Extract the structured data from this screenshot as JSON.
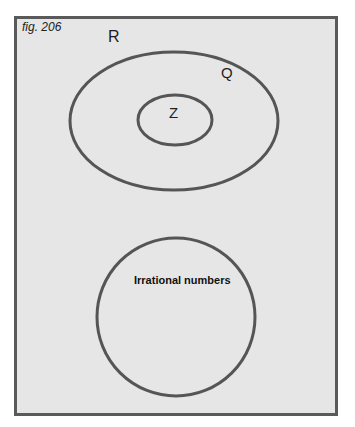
{
  "figure": {
    "caption": "fig. 206",
    "sets": [
      {
        "id": "R",
        "label": "R",
        "description": "outer frame (real numbers)"
      },
      {
        "id": "Q",
        "label": "Q",
        "shape": "ellipse",
        "cx": 174,
        "cy": 121,
        "rx": 104,
        "ry": 69
      },
      {
        "id": "Z",
        "label": "Z",
        "shape": "ellipse",
        "cx": 175,
        "cy": 120,
        "rx": 37,
        "ry": 25
      },
      {
        "id": "Irr",
        "label": "Irrational numbers",
        "shape": "circle",
        "cx": 176,
        "cy": 317,
        "r": 79
      }
    ],
    "colors": {
      "background": "#e6e6e6",
      "stroke": "#555555",
      "text": "#1e1e1e"
    }
  }
}
